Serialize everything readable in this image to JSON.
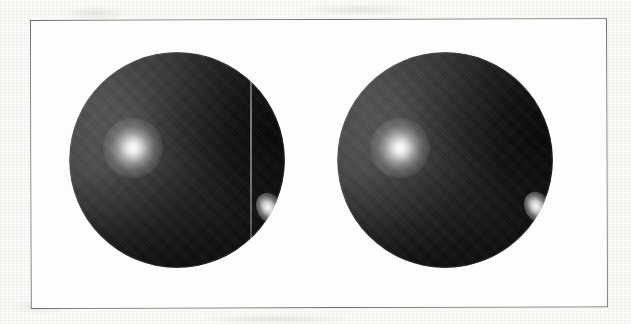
{
  "figure": {
    "kind": "rendered-image-figure",
    "caption": "",
    "background_color": "#fbfbf9",
    "frame": {
      "border_color": "#6d6d6d",
      "fill_color": "#fdfdfb",
      "x": 30,
      "y": 20,
      "width": 577,
      "height": 289,
      "rotation_deg": -0.17
    },
    "objects": [
      {
        "name": "sphere-left",
        "label": "",
        "center_x": 177,
        "center_y": 160,
        "radius": 108,
        "body_color": "#3a3a3a",
        "shadow_color": "#070707",
        "highlight_color": "#ffffff",
        "highlight_x": 133,
        "highlight_y": 148,
        "highlight_radius": 30,
        "rim_highlight_x": 270,
        "rim_highlight_y": 208,
        "rim_highlight_radius": 13,
        "has_seam_artifact": true,
        "seam_x": 250
      },
      {
        "name": "sphere-right",
        "label": "",
        "center_x": 445,
        "center_y": 160,
        "radius": 108,
        "body_color": "#3a3a3a",
        "shadow_color": "#070707",
        "highlight_color": "#ffffff",
        "highlight_x": 400,
        "highlight_y": 148,
        "highlight_radius": 30,
        "rim_highlight_x": 538,
        "rim_highlight_y": 207,
        "rim_highlight_radius": 13,
        "has_seam_artifact": false,
        "seam_x": null
      }
    ],
    "blotches": [
      {
        "x": 60,
        "y": 6,
        "w": 70,
        "h": 14
      },
      {
        "x": 300,
        "y": 4,
        "w": 120,
        "h": 12
      },
      {
        "x": 470,
        "y": 290,
        "w": 110,
        "h": 16
      },
      {
        "x": 10,
        "y": 300,
        "w": 60,
        "h": 14
      },
      {
        "x": 200,
        "y": 314,
        "w": 150,
        "h": 10
      }
    ]
  }
}
